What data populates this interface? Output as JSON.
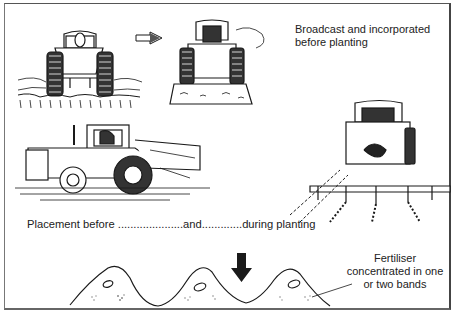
{
  "figure": {
    "labels": {
      "broadcast": "Broadcast and incorporated before planting",
      "placement": "Placement before .....................and.............during planting",
      "fertiliser": "Fertiliser concentrated in one or two bands"
    },
    "illustrations": [
      {
        "id": "tractor-spreader-rear",
        "description": "Tractor with broadcast spreader hopper, rear view, scattering fertiliser"
      },
      {
        "id": "tractor-cultivator-rear",
        "description": "Tractor with cultivator incorporating fertiliser, rear view"
      },
      {
        "id": "tractor-side-placement",
        "description": "Tractor with placement equipment, side view"
      },
      {
        "id": "tractor-planter-rear",
        "description": "Tractor with row planter/band applicator, rear view"
      },
      {
        "id": "ridge-cross-section",
        "description": "Cross-section of three ridges with seeds and fertiliser bands"
      }
    ],
    "arrows": [
      {
        "id": "sequence-arrow",
        "direction": "right"
      },
      {
        "id": "placement-arrow",
        "direction": "down"
      }
    ],
    "colors": {
      "ink": "#1a1a1a",
      "background": "#ffffff",
      "frame": "#555555"
    }
  }
}
